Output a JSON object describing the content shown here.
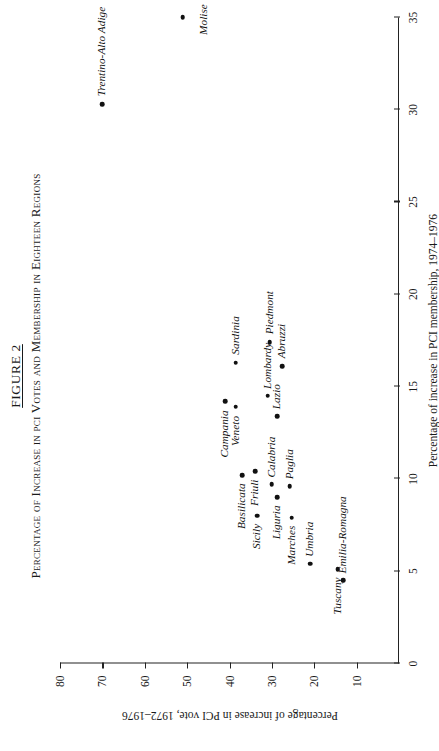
{
  "figure": {
    "number_prefix": "F",
    "number": "IGURE 2",
    "number_full": "FIGURE 2",
    "title": "Percentage of Increase in pci Votes and Membership in Eighteen Regions"
  },
  "axes": {
    "x": {
      "title": "Percentage of increase in PCI membership, 1974–1976",
      "ticks": [
        0,
        5,
        10,
        15,
        20,
        25,
        30,
        35
      ],
      "tick_labels": [
        "0",
        "5",
        "10",
        "15",
        "20",
        "25",
        "30",
        "35"
      ],
      "min": 0,
      "max": 35
    },
    "y": {
      "title": "Percentage of increase in PCI vote, 1972–1976",
      "ticks": [
        10,
        20,
        30,
        40,
        50,
        60,
        70,
        80
      ],
      "tick_labels": [
        "10",
        "20",
        "30",
        "40",
        "50",
        "60",
        "70",
        "80"
      ],
      "min": 0,
      "max": 80
    }
  },
  "chart_data": {
    "type": "scatter",
    "title": "Percentage of Increase in pci Votes and Membership in Eighteen Regions",
    "xlabel": "Percentage of increase in PCI membership, 1974–1976",
    "ylabel": "Percentage of increase in PCI vote, 1972–1976",
    "xlim": [
      0,
      35
    ],
    "ylim": [
      0,
      80
    ],
    "grid": false,
    "legend": "none",
    "points": [
      {
        "label": "Molise",
        "x": 35.0,
        "y": 51.0,
        "lx": -2,
        "ly": 14,
        "anchor": "center"
      },
      {
        "label": "Trentino-Alto Adige",
        "x": 30.3,
        "y": 70.0,
        "lx": 8,
        "ly": -1,
        "anchor": "left"
      },
      {
        "label": "Piedmont",
        "x": 17.4,
        "y": 30.5,
        "lx": 8,
        "ly": -1,
        "anchor": "left"
      },
      {
        "label": "Sardinia",
        "x": 16.3,
        "y": 38.5,
        "lx": 8,
        "ly": -1,
        "anchor": "left"
      },
      {
        "label": "Abruzzi",
        "x": 16.1,
        "y": 27.5,
        "lx": 8,
        "ly": -1,
        "anchor": "left"
      },
      {
        "label": "Lombardy",
        "x": 14.5,
        "y": 31.0,
        "lx": 7,
        "ly": -1,
        "anchor": "left"
      },
      {
        "label": "Campania",
        "x": 14.2,
        "y": 41.0,
        "lx": -9,
        "ly": -1,
        "anchor": "right"
      },
      {
        "label": "Veneto",
        "x": 13.9,
        "y": 38.5,
        "lx": -9,
        "ly": -1,
        "anchor": "right"
      },
      {
        "label": "Lazio",
        "x": 13.4,
        "y": 28.7,
        "lx": 7,
        "ly": -1,
        "anchor": "left"
      },
      {
        "label": "Friuli",
        "x": 10.4,
        "y": 34.0,
        "lx": -8,
        "ly": -1,
        "anchor": "right"
      },
      {
        "label": "Basilicata",
        "x": 10.2,
        "y": 37.0,
        "lx": -8,
        "ly": -1,
        "anchor": "right"
      },
      {
        "label": "Calabria",
        "x": 9.7,
        "y": 30.0,
        "lx": 7,
        "ly": -1,
        "anchor": "left"
      },
      {
        "label": "Paglia",
        "x": 9.6,
        "y": 25.8,
        "lx": 7,
        "ly": -1,
        "anchor": "left"
      },
      {
        "label": "Liguria",
        "x": 9.0,
        "y": 28.7,
        "lx": -8,
        "ly": -1,
        "anchor": "right"
      },
      {
        "label": "Sicily",
        "x": 8.0,
        "y": 33.5,
        "lx": -8,
        "ly": -1,
        "anchor": "right"
      },
      {
        "label": "Marches",
        "x": 7.9,
        "y": 25.3,
        "lx": -8,
        "ly": -1,
        "anchor": "right"
      },
      {
        "label": "Umbria",
        "x": 5.4,
        "y": 21.0,
        "lx": 7,
        "ly": -1,
        "anchor": "left"
      },
      {
        "label": "Tuscany",
        "x": 5.1,
        "y": 14.5,
        "lx": -8,
        "ly": -1,
        "anchor": "right"
      },
      {
        "label": "Emilia-Romagna",
        "x": 4.5,
        "y": 13.2,
        "lx": 7,
        "ly": -1,
        "anchor": "left"
      }
    ]
  }
}
